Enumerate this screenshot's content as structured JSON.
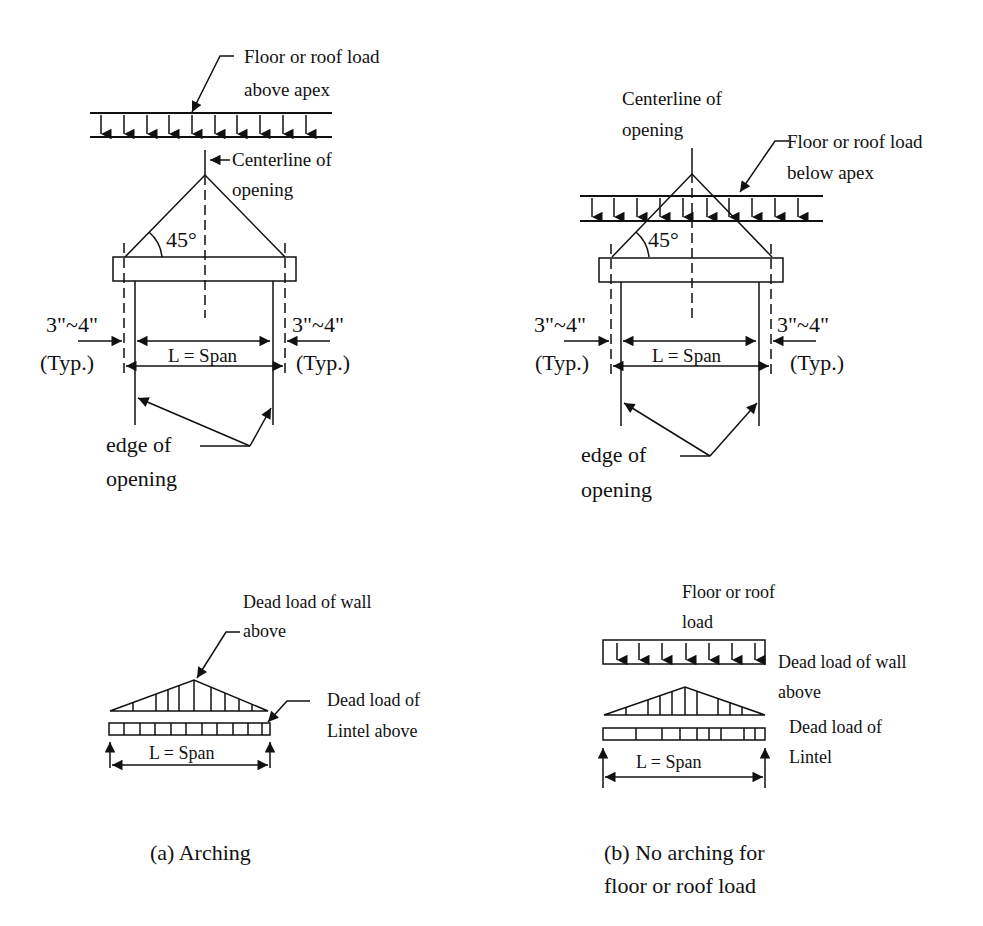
{
  "figure": {
    "panel_a": {
      "top": {
        "load_label_line1": "Floor or roof load",
        "load_label_line2": "above apex",
        "centerline_line1": "Centerline of",
        "centerline_line2": "opening",
        "angle": "45°",
        "bearing_left_line1": "3\"~4\"",
        "bearing_left_line2": "(Typ.)",
        "bearing_right_line1": "3\"~4\"",
        "bearing_right_line2": "(Typ.)",
        "span_label": "L = Span",
        "edge_line1": "edge of",
        "edge_line2": "opening"
      },
      "bottom": {
        "wall_load_line1": "Dead load of wall",
        "wall_load_line2": "above",
        "lintel_load_line1": "Dead load of",
        "lintel_load_line2": "Lintel above",
        "span_label": "L = Span"
      },
      "caption": "(a) Arching"
    },
    "panel_b": {
      "top": {
        "centerline_line1": "Centerline of",
        "centerline_line2": "opening",
        "load_label_line1": "Floor or roof load",
        "load_label_line2": "below apex",
        "angle": "45°",
        "bearing_left_line1": "3\"~4\"",
        "bearing_left_line2": "(Typ.)",
        "bearing_right_line1": "3\"~4\"",
        "bearing_right_line2": "(Typ.)",
        "span_label": "L = Span",
        "edge_line1": "edge of",
        "edge_line2": "opening"
      },
      "bottom": {
        "floor_load_line1": "Floor or roof",
        "floor_load_line2": "load",
        "wall_load_line1": "Dead load of wall",
        "wall_load_line2": "above",
        "lintel_load_line1": "Dead load of",
        "lintel_load_line2": "Lintel",
        "span_label": "L = Span"
      },
      "caption_line1": "(b) No arching for",
      "caption_line2": "floor or roof load"
    }
  }
}
